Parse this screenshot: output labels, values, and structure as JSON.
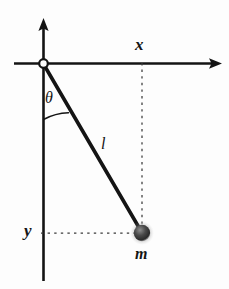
{
  "figure": {
    "type": "physics-diagram",
    "background_color": "#fdfdfd",
    "stroke_color": "#141414",
    "width": 229,
    "height": 289
  },
  "labels": {
    "x_axis": "x",
    "y_axis": "y",
    "angle": "θ",
    "length": "l",
    "mass": "m"
  },
  "geometry": {
    "origin": {
      "x": 43,
      "y": 63
    },
    "bob": {
      "x": 142,
      "y": 233,
      "radius": 8
    },
    "x_axis_line": {
      "x1": 14,
      "y1": 63,
      "x2": 222,
      "y2": 63,
      "arrow": "right"
    },
    "y_axis_line": {
      "x1": 43,
      "y1": 18,
      "x2": 43,
      "y2": 281,
      "arrow": "up"
    },
    "rod": {
      "x1": 43,
      "y1": 64,
      "x2": 142,
      "y2": 233,
      "width": 3.4
    },
    "angle_arc": {
      "start_x": 43,
      "start_y": 119,
      "end_x": 67,
      "end_y": 112,
      "radius": 56
    },
    "dashed_vertical": {
      "x": 142,
      "y1": 63,
      "y2": 233
    },
    "dashed_horizontal": {
      "y": 233,
      "x1": 41,
      "x2": 142
    }
  },
  "icon_names": {
    "origin": "origin-pivot-icon",
    "bob": "pendulum-bob-icon",
    "x_arrow": "x-axis-arrow-icon",
    "y_arrow": "y-axis-arrow-icon",
    "arc": "angle-arc-icon"
  }
}
